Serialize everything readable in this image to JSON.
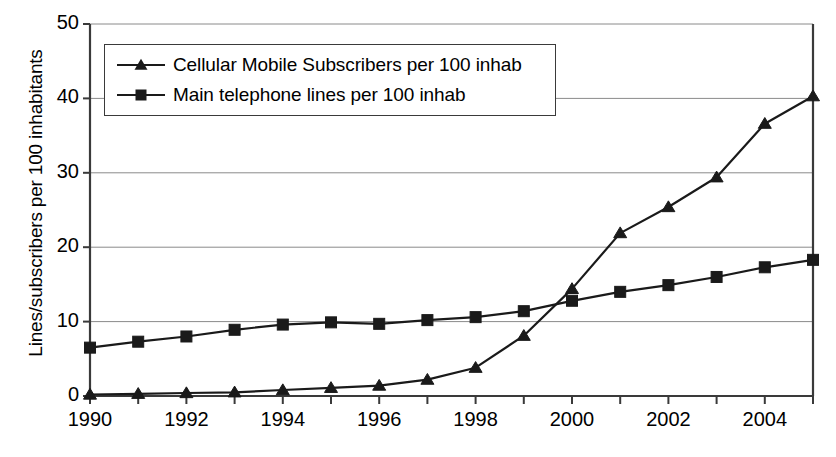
{
  "chart_data": {
    "type": "line",
    "title": "",
    "subtitle": "",
    "xlabel": "",
    "ylabel": "Lines/subscribers per 100 inhabitants",
    "x": [
      1990,
      1991,
      1992,
      1993,
      1994,
      1995,
      1996,
      1997,
      1998,
      1999,
      2000,
      2001,
      2002,
      2003,
      2004,
      2005
    ],
    "xtick_labels": [
      "1990",
      "1992",
      "1994",
      "1996",
      "1998",
      "2000",
      "2002",
      "2004"
    ],
    "xtick_values": [
      1990,
      1992,
      1994,
      1996,
      1998,
      2000,
      2002,
      2004
    ],
    "ytick_labels": [
      "0",
      "10",
      "20",
      "30",
      "40",
      "50"
    ],
    "ytick_values": [
      0,
      10,
      20,
      30,
      40,
      50
    ],
    "xlim": [
      1990,
      2005
    ],
    "ylim": [
      0,
      50
    ],
    "grid": "horizontal",
    "legend_position": "top-left",
    "series": [
      {
        "name": "Cellular Mobile Subscribers per 100 inhab",
        "marker": "triangle",
        "color": "#000000",
        "values": [
          0.2,
          0.3,
          0.4,
          0.5,
          0.8,
          1.1,
          1.4,
          2.2,
          3.8,
          8.1,
          14.4,
          21.9,
          25.4,
          29.4,
          36.6,
          40.3
        ]
      },
      {
        "name": "Main telephone lines per 100 inhab",
        "marker": "square",
        "color": "#000000",
        "values": [
          6.5,
          7.3,
          8.0,
          8.9,
          9.6,
          9.9,
          9.7,
          10.2,
          10.6,
          11.4,
          12.8,
          14.0,
          14.9,
          16.0,
          17.3,
          18.3
        ]
      }
    ]
  },
  "legend": {
    "items": [
      {
        "label": "Cellular Mobile Subscribers per 100 inhab",
        "marker": "triangle"
      },
      {
        "label": "Main telephone lines per 100 inhab",
        "marker": "square"
      }
    ]
  },
  "colors": {
    "line": "#1a1a1a",
    "grid": "#8a8a8a",
    "axis": "#3a3a3a",
    "text": "#000000",
    "background": "#ffffff"
  }
}
